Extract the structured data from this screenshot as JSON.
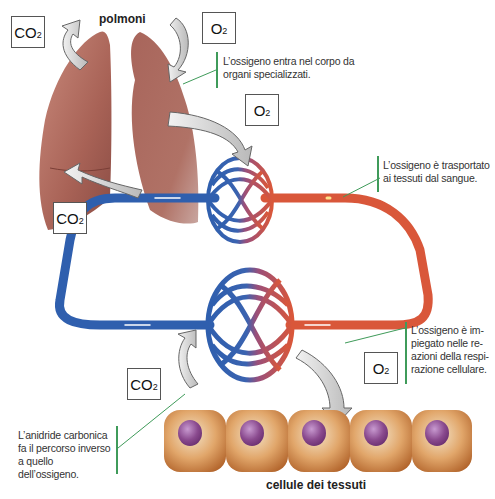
{
  "labels": {
    "lungs": "polmoni",
    "cells": "cellule dei tessuti"
  },
  "molecules": {
    "co2_main": "CO",
    "o2_main": "O",
    "subscript": "2"
  },
  "boxes": [
    {
      "id": "co2-lungs-out",
      "text": "CO",
      "sub": "2"
    },
    {
      "id": "o2-lungs-in",
      "text": "O",
      "sub": "2"
    },
    {
      "id": "o2-to-blood",
      "text": "O",
      "sub": "2"
    },
    {
      "id": "co2-from-blood",
      "text": "CO",
      "sub": "2"
    },
    {
      "id": "o2-to-cells",
      "text": "O",
      "sub": "2"
    },
    {
      "id": "co2-from-cells",
      "text": "CO",
      "sub": "2"
    }
  ],
  "notes": {
    "oxygen_enters": "L’ossigeno entra nel corpo da organi specializzati.",
    "oxygen_transported": "L’ossigeno è trasportato ai tessuti dal sangue.",
    "oxygen_used": "L’ossigeno è impiegato nelle reazioni della respirazione cellulare.",
    "co2_reverse": "L’anidride carbonica fa il percorso inverso a quello dell’ossigeno."
  },
  "notes_lines": {
    "oxygen_enters": [
      "L’ossigeno entra nel corpo da",
      "organi specializzati."
    ],
    "oxygen_transported": [
      "L’ossigeno è trasportato",
      "ai tessuti dal sangue."
    ],
    "oxygen_used": [
      "L’ossigeno è im-",
      "piegato nelle re-",
      "azioni della respi-",
      "razione cellulare."
    ],
    "co2_reverse": [
      "L’anidride carbonica",
      "fa il percorso inverso",
      "a quello dell’ossigeno."
    ]
  },
  "colors": {
    "venous_blue": "#2f5fae",
    "arterial_red": "#d9573a",
    "lung_pink": "#b06a5e",
    "cell_orange": "#c97a3e",
    "nucleus_purple": "#8a4a8e",
    "callout_green": "#3f9b5a",
    "arrow_gray": "#d8d8d8"
  },
  "cells_count": 5
}
